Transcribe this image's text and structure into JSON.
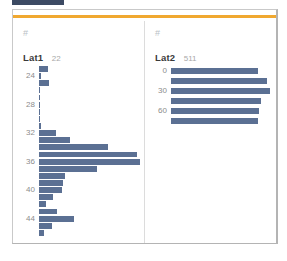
{
  "window": {
    "accent_color": "#f0a830",
    "bar_color": "#5b7093",
    "tab_stub_color": "#3c4a63"
  },
  "panels": [
    {
      "icon": "hash-icon",
      "icon_glyph": "#",
      "field_name": "Lat1",
      "field_count": "22"
    },
    {
      "icon": "hash-icon",
      "icon_glyph": "#",
      "field_name": "Lat2",
      "field_count": "511"
    }
  ],
  "chart_data": [
    {
      "type": "bar",
      "orientation": "horizontal",
      "title": "Lat1",
      "subtitle": "22",
      "xlabel": "",
      "ylabel": "",
      "grid": false,
      "legend": "none",
      "tick_labels": [
        "24",
        "28",
        "32",
        "36",
        "40",
        "44"
      ],
      "tick_values": [
        24,
        28,
        32,
        36,
        40,
        44
      ],
      "ylim": [
        22,
        46
      ],
      "xlim": [
        0,
        100
      ],
      "categories": [
        23,
        24,
        25,
        26,
        27,
        28,
        29,
        30,
        31,
        32,
        33,
        34,
        35,
        36,
        37,
        38,
        39,
        40,
        41,
        42,
        43,
        44,
        45
      ],
      "values": [
        9,
        2,
        10,
        1,
        1,
        1,
        1,
        1,
        2,
        17,
        31,
        68,
        97,
        100,
        57,
        26,
        24,
        23,
        14,
        7,
        18,
        35,
        13,
        5
      ]
    },
    {
      "type": "bar",
      "orientation": "horizontal",
      "title": "Lat2",
      "subtitle": "511",
      "xlabel": "",
      "ylabel": "",
      "grid": false,
      "legend": "none",
      "tick_labels": [
        "0",
        "30",
        "60"
      ],
      "tick_values": [
        0,
        30,
        60
      ],
      "ylim": [
        -10,
        75
      ],
      "xlim": [
        0,
        100
      ],
      "categories": [
        0,
        15,
        30,
        45,
        60,
        70
      ],
      "values": [
        88,
        97,
        100,
        91,
        89,
        88
      ]
    }
  ]
}
